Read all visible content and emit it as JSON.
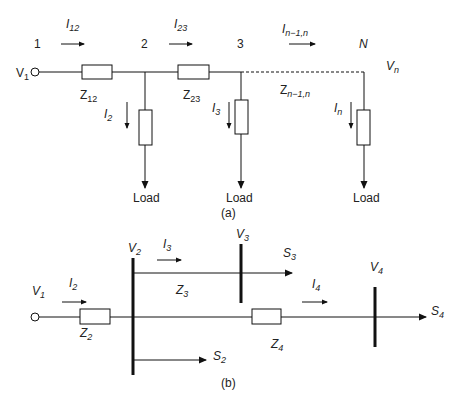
{
  "diagram_a": {
    "caption": "(a)",
    "nodes": [
      {
        "label": "1",
        "x": 38
      },
      {
        "label": "2",
        "x": 145
      },
      {
        "label": "3",
        "x": 241
      },
      {
        "label": "N",
        "x": 364
      }
    ],
    "source_voltage": {
      "main": "V",
      "sub": "1"
    },
    "end_voltage": {
      "main": "V",
      "sub": "n"
    },
    "branch_currents": [
      {
        "main": "I",
        "sub": "12"
      },
      {
        "main": "I",
        "sub": "23"
      },
      {
        "main": "I",
        "sub": "n−1,n"
      }
    ],
    "impedances": [
      {
        "main": "Z",
        "sub": "12"
      },
      {
        "main": "Z",
        "sub": "23"
      },
      {
        "main": "Z",
        "sub": "n−1,n"
      }
    ],
    "load_currents": [
      {
        "main": "I",
        "sub": "2"
      },
      {
        "main": "I",
        "sub": "3"
      },
      {
        "main": "I",
        "sub": "n"
      }
    ],
    "load_label": "Load"
  },
  "diagram_b": {
    "caption": "(b)",
    "source_voltage": {
      "main": "V",
      "sub": "1"
    },
    "bus_voltages": [
      {
        "main": "V",
        "sub": "2"
      },
      {
        "main": "V",
        "sub": "3"
      },
      {
        "main": "V",
        "sub": "4"
      }
    ],
    "currents": [
      {
        "main": "I",
        "sub": "2"
      },
      {
        "main": "I",
        "sub": "3"
      },
      {
        "main": "I",
        "sub": "4"
      }
    ],
    "impedances": [
      {
        "main": "Z",
        "sub": "2"
      },
      {
        "main": "Z",
        "sub": "3"
      },
      {
        "main": "Z",
        "sub": "4"
      }
    ],
    "powers": [
      {
        "main": "S",
        "sub": "2"
      },
      {
        "main": "S",
        "sub": "3"
      },
      {
        "main": "S",
        "sub": "4"
      }
    ]
  }
}
